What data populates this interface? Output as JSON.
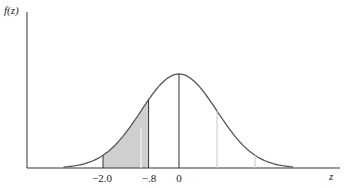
{
  "chart_data": {
    "type": "area",
    "title": "",
    "xlabel": "z",
    "ylabel": "f(z)",
    "distribution": "standard normal density",
    "mean": 0,
    "shaded_region": {
      "from": -2.0,
      "to": -0.8,
      "color": "#cfcfcf"
    },
    "vertical_lines": [
      {
        "x": -2.0,
        "color": "#333333"
      },
      {
        "x": -0.8,
        "color": "#333333"
      },
      {
        "x": 0,
        "color": "#333333"
      },
      {
        "x": 1.0,
        "color": "#c8c8c8"
      },
      {
        "x": 2.0,
        "color": "#c8c8c8"
      }
    ],
    "tick_labels": [
      "-2.0",
      "-.8",
      "0"
    ],
    "grid": false
  },
  "labels": {
    "y_axis": "f(z)",
    "x_axis": "z",
    "ticks": [
      {
        "text": "−2.0",
        "x": 102
      },
      {
        "text": "−.8",
        "x": 149
      },
      {
        "text": "0",
        "x": 179
      }
    ]
  },
  "colors": {
    "axis": "#333333",
    "curve": "#555555",
    "shade": "#cfcfcf"
  }
}
